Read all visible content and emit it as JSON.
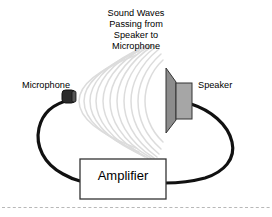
{
  "diagram": {
    "title_lines": [
      "Sound Waves",
      "Passing from",
      "Speaker to",
      "Microphone"
    ],
    "labels": {
      "microphone": "Microphone",
      "speaker": "Speaker",
      "amplifier": "Amplifier"
    },
    "components": {
      "microphone_icon": "microphone-capsule",
      "speaker_icon": "speaker-cone",
      "amplifier_box": "amplifier-rectangle",
      "sound_waves": "concentric-wave-arcs",
      "cable_left": "microphone-to-amplifier-cable",
      "cable_right": "speaker-to-amplifier-cable",
      "footer_rule": "dashed-separator-line"
    },
    "colors": {
      "background": "#ffffff",
      "ink": "#000000",
      "cable": "#111111",
      "speaker_cone": "#8c8c8c",
      "speaker_body": "#a6a6a6",
      "microphone_body": "#2b2b2b",
      "sound_wave": "#dcdcdc",
      "amplifier_fill": "#ffffff",
      "amplifier_border": "#333333",
      "footer_rule": "#b8b8b8"
    },
    "wave_count": 11
  }
}
